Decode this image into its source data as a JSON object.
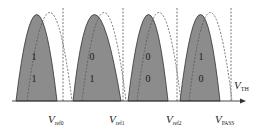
{
  "diagram": {
    "type": "threshold-voltage-distribution",
    "axis_label": {
      "main": "V",
      "sub": "TH"
    },
    "colors": {
      "fill": "#8c8c8c",
      "outline": "#333333",
      "dashed": "#555555",
      "axis": "#333333"
    },
    "states": [
      {
        "upper_bit": "1",
        "lower_bit": "1"
      },
      {
        "upper_bit": "0",
        "lower_bit": "1"
      },
      {
        "upper_bit": "0",
        "lower_bit": "0"
      },
      {
        "upper_bit": "1",
        "lower_bit": "0"
      }
    ],
    "reference_labels": [
      {
        "main": "V",
        "sub": "ref0"
      },
      {
        "main": "V",
        "sub": "ref1"
      },
      {
        "main": "V",
        "sub": "ref2"
      },
      {
        "main": "V",
        "sub": "PASS"
      }
    ]
  }
}
